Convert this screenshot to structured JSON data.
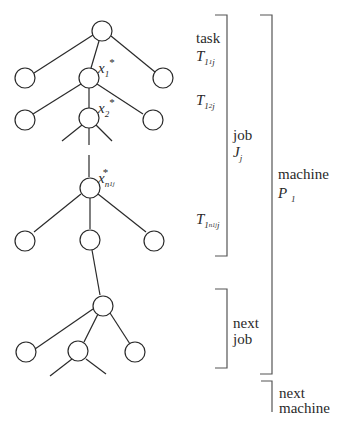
{
  "diagram": {
    "type": "tree-with-brackets",
    "nodes": {
      "x1": {
        "var": "x",
        "sub": "1",
        "sup": "*"
      },
      "x2": {
        "var": "x",
        "sub": "2",
        "sup": "*"
      },
      "xn1j": {
        "var": "x",
        "sub": "n",
        "subsub": "1j",
        "sup": "*"
      }
    },
    "labels": {
      "task": "task",
      "t11j": {
        "var": "T",
        "sub": "1",
        "subsub": "1",
        "tail": "j"
      },
      "t12j": {
        "var": "T",
        "sub": "1",
        "subsub": "2",
        "tail": "j"
      },
      "t1n1jj": {
        "var": "T",
        "sub": "1",
        "subsub": "n",
        "subsubsub": "1j",
        "tail": "j"
      },
      "job": "job",
      "jj": {
        "var": "J",
        "sub": "j"
      },
      "machine": "machine",
      "p1": {
        "var": "P",
        "sub": "1"
      },
      "next_job_line1": "next",
      "next_job_line2": "job",
      "next_machine_line1": "next",
      "next_machine_line2": "machine"
    },
    "colors": {
      "stroke": "#2a2a2a",
      "bracket": "#555555",
      "background": "#ffffff"
    }
  }
}
